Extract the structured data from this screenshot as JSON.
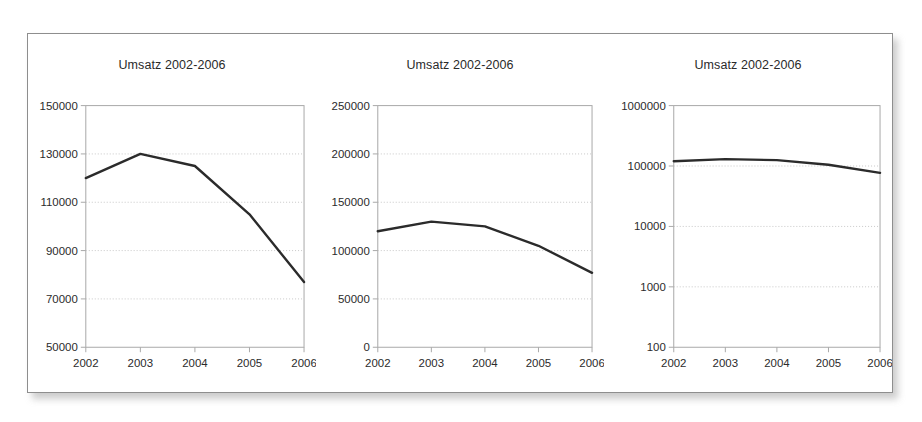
{
  "figure": {
    "background_color": "#ffffff",
    "frame_border_color": "#8e8e8e",
    "series_color": "#2b2b2b",
    "gridline_color": "#c8c8c8",
    "axis_color": "#a8a8a8"
  },
  "charts": [
    {
      "title": "Umsatz 2002-2006",
      "y_ticks": [
        "150000",
        "130000",
        "110000",
        "90000",
        "70000",
        "50000"
      ],
      "x_ticks": [
        "2002",
        "2003",
        "2004",
        "2005",
        "2006"
      ],
      "scale": "linear",
      "ylim": [
        50000,
        150000
      ]
    },
    {
      "title": "Umsatz 2002-2006",
      "y_ticks": [
        "250000",
        "200000",
        "150000",
        "100000",
        "50000",
        "0"
      ],
      "x_ticks": [
        "2002",
        "2003",
        "2004",
        "2005",
        "2006"
      ],
      "scale": "linear",
      "ylim": [
        0,
        250000
      ]
    },
    {
      "title": "Umsatz 2002-2006",
      "y_ticks": [
        "1000000",
        "100000",
        "10000",
        "1000",
        "100"
      ],
      "x_ticks": [
        "2002",
        "2003",
        "2004",
        "2005",
        "2006"
      ],
      "scale": "log",
      "ylim": [
        100,
        1000000
      ]
    }
  ],
  "chart_data": [
    {
      "type": "line",
      "title": "Umsatz 2002-2006",
      "xlabel": "",
      "ylabel": "",
      "x": [
        "2002",
        "2003",
        "2004",
        "2005",
        "2006"
      ],
      "categories": [
        "2002",
        "2003",
        "2004",
        "2005",
        "2006"
      ],
      "values": [
        120000,
        130000,
        125000,
        105000,
        77000
      ],
      "series": [
        {
          "name": "Umsatz",
          "values": [
            120000,
            130000,
            125000,
            105000,
            77000
          ]
        }
      ],
      "yscale": "linear",
      "ylim": [
        50000,
        150000
      ],
      "yticks": [
        50000,
        70000,
        90000,
        110000,
        130000,
        150000
      ],
      "grid": true,
      "legend": "none"
    },
    {
      "type": "line",
      "title": "Umsatz 2002-2006",
      "xlabel": "",
      "ylabel": "",
      "x": [
        "2002",
        "2003",
        "2004",
        "2005",
        "2006"
      ],
      "categories": [
        "2002",
        "2003",
        "2004",
        "2005",
        "2006"
      ],
      "values": [
        120000,
        130000,
        125000,
        105000,
        77000
      ],
      "series": [
        {
          "name": "Umsatz",
          "values": [
            120000,
            130000,
            125000,
            105000,
            77000
          ]
        }
      ],
      "yscale": "linear",
      "ylim": [
        0,
        250000
      ],
      "yticks": [
        0,
        50000,
        100000,
        150000,
        200000,
        250000
      ],
      "grid": true,
      "legend": "none"
    },
    {
      "type": "line",
      "title": "Umsatz 2002-2006",
      "xlabel": "",
      "ylabel": "",
      "x": [
        "2002",
        "2003",
        "2004",
        "2005",
        "2006"
      ],
      "categories": [
        "2002",
        "2003",
        "2004",
        "2005",
        "2006"
      ],
      "values": [
        120000,
        130000,
        125000,
        105000,
        77000
      ],
      "series": [
        {
          "name": "Umsatz",
          "values": [
            120000,
            130000,
            125000,
            105000,
            77000
          ]
        }
      ],
      "yscale": "log",
      "ylim": [
        100,
        1000000
      ],
      "yticks": [
        100,
        1000,
        10000,
        100000,
        1000000
      ],
      "grid": true,
      "legend": "none"
    }
  ]
}
